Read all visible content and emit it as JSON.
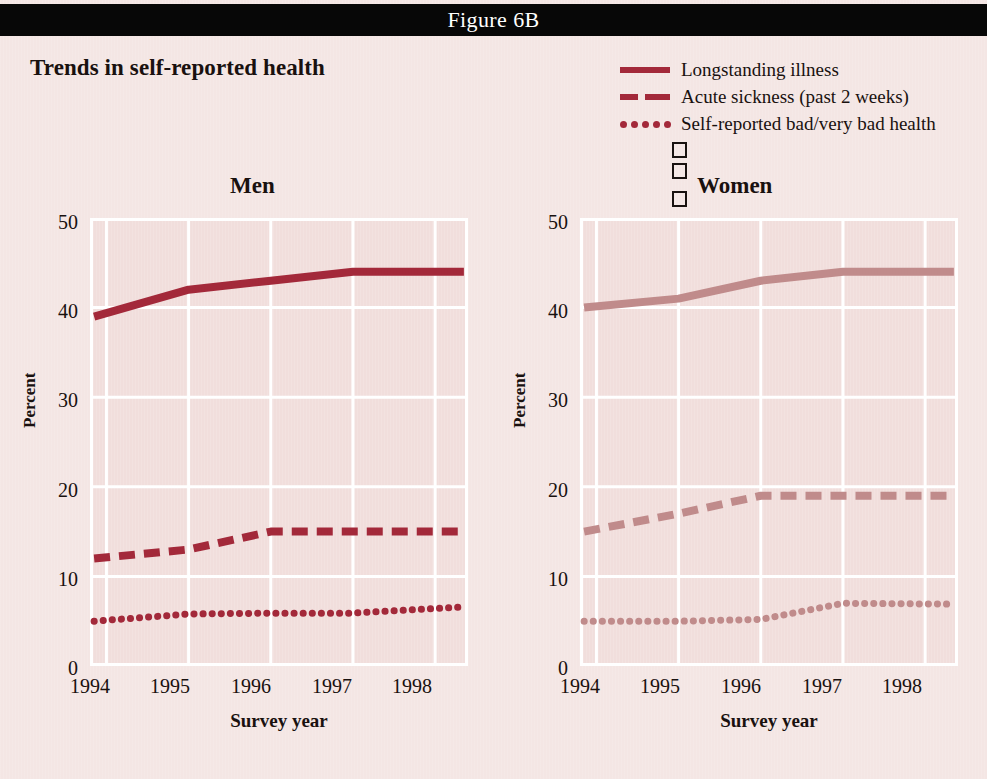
{
  "header": {
    "figure_label": "Figure 6B"
  },
  "main_title": "Trends in self-reported health",
  "legend": {
    "items": [
      {
        "label": "Longstanding illness",
        "style": "solid",
        "swatch_color": "#a3293a"
      },
      {
        "label": "Acute sickness (past 2 weeks)",
        "style": "dashed",
        "swatch_color": "#a3293a"
      },
      {
        "label": "Self-reported bad/very bad health",
        "style": "dotted",
        "swatch_color": "#a3293a"
      }
    ],
    "stray_glyphs": [
      "□",
      "□",
      "□"
    ]
  },
  "panels": {
    "men": {
      "title": "Men",
      "ylabel": "Percent",
      "xlabel": "Survey year",
      "yticks": [
        "50",
        "40",
        "30",
        "20",
        "10",
        "0"
      ],
      "xticks": [
        "1994",
        "1995",
        "1996",
        "1997",
        "1998"
      ]
    },
    "women": {
      "title": "Women",
      "ylabel": "Percent",
      "xlabel": "Survey year",
      "yticks": [
        "50",
        "40",
        "30",
        "20",
        "10",
        "0"
      ],
      "xticks": [
        "1994",
        "1995",
        "1996",
        "1997",
        "1998"
      ]
    }
  },
  "chart_data": [
    {
      "type": "line",
      "title": "Men",
      "xlabel": "Survey year",
      "ylabel": "Percent",
      "xlim": [
        1993.8,
        1998.4
      ],
      "ylim": [
        0,
        50
      ],
      "yticks": [
        0,
        10,
        20,
        30,
        40,
        50
      ],
      "xticks": [
        1994,
        1995,
        1996,
        1997,
        1998
      ],
      "grid": true,
      "legend_position": "top-right-shared",
      "line_color": "#a3293a",
      "series": [
        {
          "name": "Longstanding illness",
          "style": "solid",
          "x": [
            1993.85,
            1995.0,
            1996.0,
            1997.0,
            1998.35
          ],
          "values": [
            39.0,
            42.0,
            43.0,
            44.0,
            44.0
          ]
        },
        {
          "name": "Acute sickness (past 2 weeks)",
          "style": "dashed",
          "x": [
            1993.85,
            1995.0,
            1996.0,
            1997.0,
            1998.35
          ],
          "values": [
            12.0,
            13.0,
            15.0,
            15.0,
            15.0
          ]
        },
        {
          "name": "Self-reported bad/very bad health",
          "style": "dotted",
          "x": [
            1993.85,
            1995.0,
            1996.0,
            1997.0,
            1998.35
          ],
          "values": [
            5.0,
            5.8,
            5.9,
            5.9,
            6.6
          ]
        }
      ]
    },
    {
      "type": "line",
      "title": "Women",
      "xlabel": "Survey year",
      "ylabel": "Percent",
      "xlim": [
        1993.8,
        1998.4
      ],
      "ylim": [
        0,
        50
      ],
      "yticks": [
        0,
        10,
        20,
        30,
        40,
        50
      ],
      "xticks": [
        1994,
        1995,
        1996,
        1997,
        1998
      ],
      "grid": true,
      "legend_position": "top-right-shared",
      "line_color": "#c08b8b",
      "series": [
        {
          "name": "Longstanding illness",
          "style": "solid",
          "x": [
            1993.85,
            1995.0,
            1996.0,
            1997.0,
            1998.35
          ],
          "values": [
            40.0,
            41.0,
            43.0,
            44.0,
            44.0
          ]
        },
        {
          "name": "Acute sickness (past 2 weeks)",
          "style": "dashed",
          "x": [
            1993.85,
            1995.0,
            1996.0,
            1997.0,
            1998.35
          ],
          "values": [
            15.0,
            17.0,
            19.0,
            19.0,
            19.0
          ]
        },
        {
          "name": "Self-reported bad/very bad health",
          "style": "dotted",
          "x": [
            1993.85,
            1995.0,
            1996.0,
            1997.0,
            1998.35
          ],
          "values": [
            5.0,
            5.0,
            5.2,
            7.0,
            6.9
          ]
        }
      ]
    }
  ]
}
